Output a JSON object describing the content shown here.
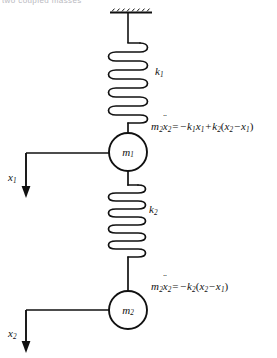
{
  "figure": {
    "clipped_header_text": "two coupled masses",
    "background_color": "#ffffff",
    "stroke_color": "#111111"
  },
  "support": {
    "label": "ceiling-support"
  },
  "springs": [
    {
      "id": "spring-k1",
      "label_k": "k",
      "label_sub": "1",
      "coils": 9
    },
    {
      "id": "spring-k2",
      "label_k": "k",
      "label_sub": "2",
      "coils": 9
    }
  ],
  "masses": [
    {
      "id": "mass-m1",
      "label_m": "m",
      "label_sub": "1"
    },
    {
      "id": "mass-m2",
      "label_m": "m",
      "label_sub": "2"
    }
  ],
  "displacements": [
    {
      "id": "x1",
      "label_x": "x",
      "label_sub": "1",
      "direction": "down"
    },
    {
      "id": "x2",
      "label_x": "x",
      "label_sub": "2",
      "direction": "down"
    }
  ],
  "equations": {
    "eq1": {
      "lhs_m": "m",
      "lhs_m_sub": "2",
      "lhs_x": "x",
      "lhs_x_sub": "2",
      "equals": "=",
      "t1_sign": "−",
      "t1_k": "k",
      "t1_k_sub": "1",
      "t1_x": "x",
      "t1_x_sub": "1",
      "t2_sign": "+",
      "t2_k": "k",
      "t2_k_sub": "2",
      "open_paren": "(",
      "t2_xa": "x",
      "t2_xa_sub": "2",
      "t2_minus": "−",
      "t2_xb": "x",
      "t2_xb_sub": "1",
      "close_paren": ")"
    },
    "eq2": {
      "lhs_m": "m",
      "lhs_m_sub": "2",
      "lhs_x": "x",
      "lhs_x_sub": "2",
      "equals": "=",
      "t1_sign": "−",
      "t1_k": "k",
      "t1_k_sub": "2",
      "open_paren": "(",
      "t1_xa": "x",
      "t1_xa_sub": "2",
      "t1_minus": "−",
      "t1_xb": "x",
      "t1_xb_sub": "1",
      "close_paren": ")"
    }
  }
}
